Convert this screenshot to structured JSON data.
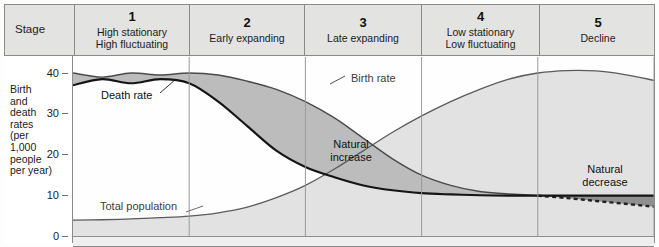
{
  "header": {
    "stage_label": "Stage",
    "stages": [
      {
        "number": "1",
        "name": "High stationary\nHigh fluctuating"
      },
      {
        "number": "2",
        "name": "Early expanding"
      },
      {
        "number": "3",
        "name": "Late expanding"
      },
      {
        "number": "4",
        "name": "Low stationary\nLow fluctuating"
      },
      {
        "number": "5",
        "name": "Decline"
      }
    ]
  },
  "axis": {
    "y_label": "Birth and death rates (per 1,000 people per year)",
    "y_ticks": [
      "40",
      "30",
      "20",
      "10",
      "0"
    ]
  },
  "annotations": {
    "death_rate": "Death rate",
    "birth_rate": "Birth rate",
    "total_population": "Total population",
    "natural_increase": "Natural\nincrease",
    "natural_decrease": "Natural\ndecrease"
  },
  "colors": {
    "header_fill": "#e3e3e1",
    "border": "#8a8a88",
    "natural_increase_fill": "#bcbcbc",
    "natural_decrease_fill": "#8f8f8f",
    "population_fill": "#e2e2e2",
    "death_rate_line": "#1a1a1a",
    "birth_rate_line": "#4a4a4a",
    "population_line": "#5b5b5b"
  },
  "chart_data": {
    "type": "area",
    "xlabel": "Stage",
    "ylabel": "Birth and death rates (per 1,000 people per year)",
    "ylim": [
      0,
      42
    ],
    "grid": false,
    "legend_position": "inline-annotations",
    "stage_boundaries_x": [
      0,
      1,
      2,
      3,
      4,
      5
    ],
    "x": [
      0.0,
      0.25,
      0.5,
      0.75,
      1.0,
      1.25,
      1.5,
      1.75,
      2.0,
      2.25,
      2.5,
      2.75,
      3.0,
      3.25,
      3.5,
      3.75,
      4.0,
      4.25,
      4.5,
      4.75,
      5.0
    ],
    "series": [
      {
        "name": "Birth rate",
        "style": "solid-to-dashed",
        "values": [
          40,
          39,
          40,
          39.5,
          40,
          39.5,
          38,
          36,
          33,
          29,
          24,
          19,
          15,
          12.5,
          11,
          10.4,
          10,
          9.4,
          8.7,
          8.0,
          7.3
        ]
      },
      {
        "name": "Death rate",
        "style": "solid-thick",
        "values": [
          37,
          38.5,
          37.5,
          38.5,
          37.5,
          33,
          27,
          21,
          17,
          14.5,
          12.5,
          11.3,
          10.6,
          10.3,
          10.1,
          10.0,
          10.0,
          10.0,
          10.0,
          10.0,
          10.0
        ]
      },
      {
        "name": "Total population",
        "style": "solid-thin",
        "values": [
          4.0,
          4.1,
          4.3,
          4.6,
          5.0,
          5.8,
          7.2,
          9.5,
          12.5,
          16.5,
          21,
          25.5,
          29.5,
          33,
          36,
          38.5,
          40,
          40.6,
          40.5,
          39.6,
          38.2
        ]
      }
    ],
    "regions": [
      {
        "name": "Natural increase",
        "between": [
          "Birth rate",
          "Death rate"
        ],
        "sign": "positive"
      },
      {
        "name": "Natural decrease",
        "between": [
          "Death rate",
          "Birth rate"
        ],
        "sign": "negative"
      }
    ]
  }
}
